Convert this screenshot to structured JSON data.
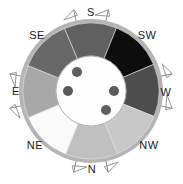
{
  "figure": {
    "background_color": "#ffffff"
  },
  "compass": {
    "center_x": 91,
    "center_y": 91,
    "outer_radius": 72,
    "inner_radius": 35,
    "rim_color": "#b4b4b4",
    "hub_color": "#fdfdfd",
    "hub_stroke": "#9a9a9a",
    "marker_color": "#8c8c8c"
  },
  "labels": [
    {
      "name": "label-s",
      "text": "S",
      "x": 91,
      "y": 13,
      "angle_deg": 270
    },
    {
      "name": "label-sw",
      "text": "SW",
      "x": 147,
      "y": 36,
      "angle_deg": 315
    },
    {
      "name": "label-w",
      "text": "W",
      "x": 166,
      "y": 93,
      "angle_deg": 0
    },
    {
      "name": "label-nw",
      "text": "NW",
      "x": 149,
      "y": 146,
      "angle_deg": 45
    },
    {
      "name": "label-n",
      "text": "N",
      "x": 92,
      "y": 170,
      "angle_deg": 90
    },
    {
      "name": "label-ne",
      "text": "NE",
      "x": 35,
      "y": 146,
      "angle_deg": 135
    },
    {
      "name": "label-e",
      "text": "E",
      "x": 16,
      "y": 92,
      "angle_deg": 180
    },
    {
      "name": "label-se",
      "text": "SE",
      "x": 37,
      "y": 36,
      "angle_deg": 225
    }
  ],
  "segments": [
    {
      "name": "segment-s-sw",
      "label": "S-SW",
      "start_deg": 247,
      "end_deg": 292,
      "color": "#606060"
    },
    {
      "name": "segment-sw",
      "label": "SW",
      "start_deg": 292,
      "end_deg": 337,
      "color": "#0d0d0d"
    },
    {
      "name": "segment-sw-w",
      "label": "SW-W",
      "start_deg": 337,
      "end_deg": 22,
      "color": "#4d4d4d"
    },
    {
      "name": "segment-w-nw",
      "label": "W-NW",
      "start_deg": 22,
      "end_deg": 67,
      "color": "#c8c8c8"
    },
    {
      "name": "segment-nw-n",
      "label": "NW-N",
      "start_deg": 67,
      "end_deg": 112,
      "color": "#c0c0c0"
    },
    {
      "name": "segment-n-ne",
      "label": "N-NE",
      "start_deg": 112,
      "end_deg": 157,
      "color": "#fafafa"
    },
    {
      "name": "segment-ne-e",
      "label": "NE-E",
      "start_deg": 157,
      "end_deg": 202,
      "color": "#a8a8a8"
    },
    {
      "name": "segment-e-se",
      "label": "E-SE",
      "start_deg": 202,
      "end_deg": 247,
      "color": "#676767"
    }
  ],
  "hub_dots": [
    {
      "name": "hub-dot-1",
      "x": 77,
      "y": 72,
      "r": 5,
      "color": "#5f5f5f"
    },
    {
      "name": "hub-dot-2",
      "x": 68,
      "y": 91,
      "r": 5,
      "color": "#5a5a5a"
    },
    {
      "name": "hub-dot-3",
      "x": 114,
      "y": 91,
      "r": 5,
      "color": "#5a5a5a"
    },
    {
      "name": "hub-dot-4",
      "x": 106,
      "y": 110,
      "r": 5,
      "color": "#606060"
    }
  ],
  "rim_markers": [
    {
      "name": "rim-marker-1",
      "angle_deg": 258
    },
    {
      "name": "rim-marker-2",
      "angle_deg": 282
    },
    {
      "name": "rim-marker-3",
      "angle_deg": 348
    },
    {
      "name": "rim-marker-4",
      "angle_deg": 12
    },
    {
      "name": "rim-marker-5",
      "angle_deg": 78
    },
    {
      "name": "rim-marker-6",
      "angle_deg": 102
    },
    {
      "name": "rim-marker-7",
      "angle_deg": 168
    },
    {
      "name": "rim-marker-8",
      "angle_deg": 192
    }
  ]
}
